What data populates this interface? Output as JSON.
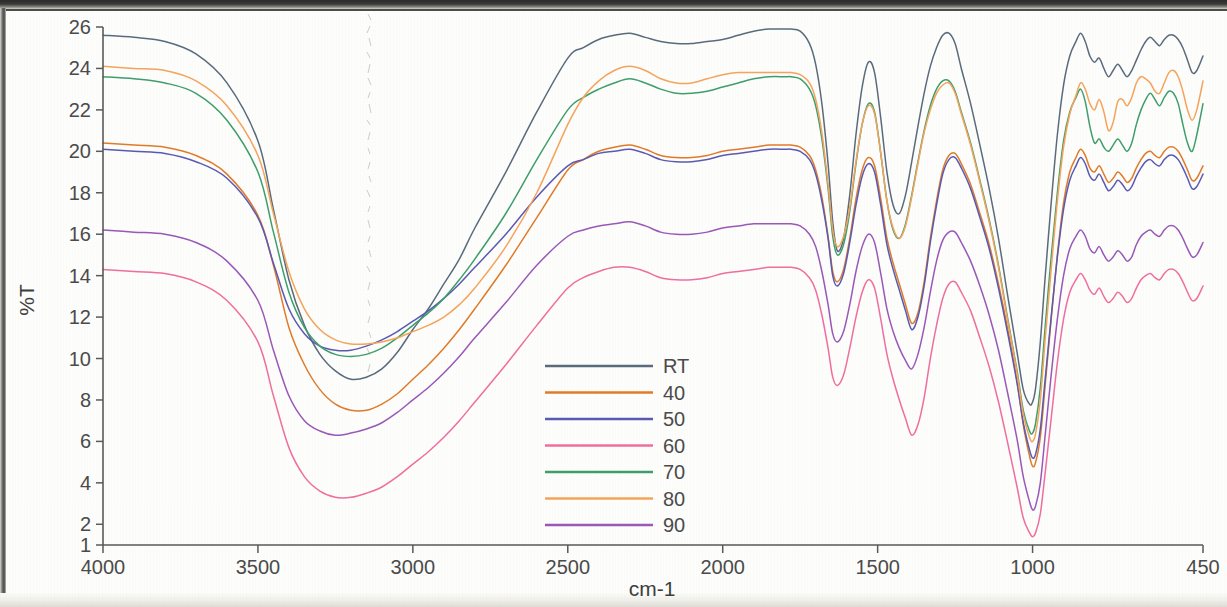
{
  "chart_data": {
    "type": "line",
    "title": "",
    "xlabel": "cm-1",
    "ylabel": "%T",
    "xlim": [
      4000,
      450
    ],
    "ylim": [
      1,
      26
    ],
    "x_ticks": [
      4000,
      3500,
      3000,
      2500,
      2000,
      1500,
      1000,
      450
    ],
    "x_tick_labels": [
      "4000",
      "3500",
      "3000",
      "2500",
      "2000",
      "1500",
      "1000",
      "450"
    ],
    "y_ticks": [
      1,
      2,
      4,
      6,
      8,
      10,
      12,
      14,
      16,
      18,
      20,
      22,
      24,
      26
    ],
    "y_tick_labels": [
      "1",
      "2",
      "4",
      "6",
      "8",
      "10",
      "12",
      "14",
      "16",
      "18",
      "20",
      "22",
      "24",
      "26"
    ],
    "x_axis_inverted": true,
    "grid": false,
    "legend_position": "center",
    "x": [
      4000,
      3900,
      3800,
      3700,
      3600,
      3500,
      3450,
      3400,
      3350,
      3300,
      3250,
      3200,
      3150,
      3100,
      3050,
      3000,
      2950,
      2900,
      2850,
      2800,
      2700,
      2600,
      2500,
      2450,
      2400,
      2350,
      2300,
      2250,
      2200,
      2150,
      2100,
      2050,
      2000,
      1950,
      1900,
      1850,
      1800,
      1780,
      1750,
      1720,
      1700,
      1680,
      1660,
      1645,
      1630,
      1610,
      1590,
      1570,
      1550,
      1530,
      1510,
      1490,
      1470,
      1450,
      1430,
      1410,
      1390,
      1370,
      1350,
      1330,
      1310,
      1290,
      1270,
      1250,
      1230,
      1200,
      1170,
      1140,
      1110,
      1080,
      1050,
      1030,
      1010,
      1000,
      990,
      975,
      960,
      940,
      920,
      900,
      880,
      860,
      845,
      830,
      815,
      800,
      785,
      770,
      755,
      740,
      725,
      710,
      695,
      680,
      665,
      650,
      635,
      620,
      605,
      590,
      575,
      560,
      545,
      530,
      515,
      500,
      485,
      470,
      450
    ],
    "series": [
      {
        "name": "RT",
        "color": "#5a6b7d",
        "values": [
          25.6,
          25.5,
          25.3,
          24.7,
          23.3,
          20.5,
          17.2,
          13.8,
          11.6,
          10.2,
          9.4,
          9.0,
          9.1,
          9.5,
          10.3,
          11.4,
          12.4,
          13.6,
          14.8,
          16.3,
          19.0,
          21.9,
          24.5,
          25.0,
          25.4,
          25.6,
          25.7,
          25.5,
          25.3,
          25.2,
          25.2,
          25.3,
          25.4,
          25.6,
          25.8,
          25.9,
          25.9,
          25.9,
          25.8,
          25.2,
          24.2,
          22.3,
          19.4,
          16.6,
          15.2,
          15.8,
          17.9,
          20.8,
          23.1,
          24.3,
          23.8,
          21.6,
          19.0,
          17.4,
          17.0,
          17.9,
          19.5,
          21.2,
          22.8,
          24.1,
          25.0,
          25.6,
          25.7,
          25.2,
          24.0,
          22.3,
          20.3,
          18.2,
          15.8,
          13.0,
          10.3,
          8.5,
          7.8,
          7.9,
          8.6,
          10.8,
          13.8,
          17.5,
          20.8,
          23.2,
          24.6,
          25.3,
          25.7,
          25.3,
          24.6,
          24.3,
          24.5,
          24.0,
          23.6,
          23.9,
          24.2,
          23.9,
          23.6,
          23.9,
          24.4,
          24.9,
          25.3,
          25.5,
          25.3,
          25.1,
          25.4,
          25.6,
          25.6,
          25.4,
          25.0,
          24.4,
          23.8,
          23.9,
          24.6
        ]
      },
      {
        "name": "40",
        "color": "#e07b2a",
        "values": [
          20.4,
          20.3,
          20.2,
          19.8,
          18.9,
          16.9,
          14.5,
          11.5,
          9.7,
          8.5,
          7.8,
          7.5,
          7.5,
          7.8,
          8.3,
          9.0,
          9.7,
          10.5,
          11.4,
          12.4,
          14.5,
          16.8,
          19.1,
          19.6,
          20.0,
          20.2,
          20.3,
          20.1,
          19.8,
          19.7,
          19.7,
          19.8,
          20.0,
          20.1,
          20.2,
          20.3,
          20.3,
          20.3,
          20.2,
          19.8,
          19.1,
          17.8,
          15.9,
          14.2,
          13.7,
          14.3,
          15.8,
          17.7,
          19.1,
          19.7,
          19.3,
          17.7,
          15.8,
          14.6,
          13.6,
          12.6,
          11.7,
          12.2,
          13.7,
          15.8,
          17.6,
          19.1,
          19.8,
          19.9,
          19.4,
          18.4,
          17.0,
          15.5,
          13.6,
          11.4,
          8.9,
          6.8,
          5.3,
          4.8,
          5.0,
          6.2,
          8.6,
          11.9,
          15.0,
          17.5,
          19.0,
          19.7,
          20.1,
          19.8,
          19.2,
          19.0,
          19.3,
          18.9,
          18.5,
          18.7,
          19.0,
          18.8,
          18.5,
          18.7,
          19.2,
          19.6,
          19.9,
          20.0,
          19.8,
          19.7,
          20.0,
          20.2,
          20.2,
          20.0,
          19.6,
          19.1,
          18.6,
          18.7,
          19.3
        ]
      },
      {
        "name": "50",
        "color": "#5a5ab4",
        "values": [
          20.1,
          20.0,
          19.9,
          19.5,
          18.7,
          16.8,
          14.6,
          12.4,
          11.2,
          10.6,
          10.4,
          10.4,
          10.6,
          10.9,
          11.3,
          11.8,
          12.3,
          12.9,
          13.6,
          14.4,
          16.0,
          17.8,
          19.3,
          19.6,
          19.9,
          20.0,
          20.1,
          19.9,
          19.6,
          19.5,
          19.5,
          19.6,
          19.8,
          19.9,
          20.0,
          20.1,
          20.1,
          20.1,
          20.0,
          19.6,
          18.9,
          17.6,
          15.8,
          14.0,
          13.5,
          14.1,
          15.6,
          17.4,
          18.8,
          19.4,
          19.0,
          17.4,
          15.5,
          14.3,
          13.3,
          12.3,
          11.4,
          12.0,
          13.5,
          15.6,
          17.4,
          18.9,
          19.6,
          19.7,
          19.2,
          18.2,
          16.8,
          15.3,
          13.4,
          11.2,
          8.8,
          6.9,
          5.6,
          5.2,
          5.4,
          6.6,
          8.9,
          12.0,
          14.9,
          17.2,
          18.6,
          19.3,
          19.7,
          19.4,
          18.8,
          18.6,
          18.9,
          18.5,
          18.1,
          18.3,
          18.6,
          18.4,
          18.1,
          18.3,
          18.8,
          19.2,
          19.5,
          19.6,
          19.4,
          19.3,
          19.6,
          19.8,
          19.8,
          19.6,
          19.2,
          18.7,
          18.2,
          18.3,
          18.9
        ]
      },
      {
        "name": "60",
        "color": "#f06ea0",
        "values": [
          14.3,
          14.2,
          14.1,
          13.7,
          12.8,
          10.8,
          8.2,
          5.7,
          4.3,
          3.6,
          3.3,
          3.3,
          3.5,
          3.8,
          4.3,
          4.9,
          5.5,
          6.2,
          7.0,
          7.9,
          9.7,
          11.6,
          13.4,
          13.9,
          14.2,
          14.4,
          14.4,
          14.2,
          13.9,
          13.8,
          13.8,
          13.9,
          14.1,
          14.2,
          14.3,
          14.4,
          14.4,
          14.4,
          14.3,
          13.9,
          13.3,
          12.1,
          10.5,
          9.1,
          8.7,
          9.2,
          10.5,
          12.0,
          13.2,
          13.8,
          13.4,
          11.9,
          10.2,
          9.0,
          8.0,
          7.1,
          6.3,
          6.8,
          8.1,
          10.0,
          11.6,
          12.9,
          13.6,
          13.7,
          13.2,
          12.3,
          11.0,
          9.6,
          7.9,
          5.9,
          3.8,
          2.3,
          1.6,
          1.4,
          1.6,
          2.5,
          4.4,
          7.1,
          9.8,
          11.9,
          13.2,
          13.8,
          14.1,
          13.8,
          13.3,
          13.1,
          13.4,
          13.0,
          12.7,
          12.9,
          13.2,
          13.0,
          12.7,
          12.9,
          13.4,
          13.8,
          14.0,
          14.1,
          13.9,
          13.8,
          14.1,
          14.3,
          14.3,
          14.1,
          13.7,
          13.2,
          12.8,
          12.9,
          13.5
        ]
      },
      {
        "name": "70",
        "color": "#3f9e6c",
        "values": [
          23.6,
          23.5,
          23.3,
          22.8,
          21.5,
          19.0,
          16.1,
          13.2,
          11.5,
          10.6,
          10.2,
          10.1,
          10.2,
          10.5,
          11.0,
          11.6,
          12.2,
          12.9,
          13.8,
          14.8,
          17.0,
          19.6,
          22.0,
          22.6,
          23.0,
          23.3,
          23.5,
          23.3,
          23.0,
          22.8,
          22.8,
          22.9,
          23.1,
          23.3,
          23.5,
          23.6,
          23.6,
          23.6,
          23.5,
          23.0,
          22.2,
          20.6,
          18.2,
          15.9,
          15.0,
          15.5,
          17.1,
          19.4,
          21.3,
          22.3,
          21.9,
          19.9,
          17.6,
          16.2,
          15.8,
          16.5,
          17.9,
          19.5,
          21.0,
          22.2,
          23.0,
          23.4,
          23.4,
          22.9,
          21.9,
          20.4,
          18.6,
          16.7,
          14.5,
          11.9,
          9.4,
          7.5,
          6.5,
          6.4,
          6.9,
          8.6,
          11.4,
          14.9,
          18.0,
          20.5,
          21.9,
          22.6,
          23.0,
          22.4,
          21.2,
          20.4,
          20.6,
          20.2,
          20.0,
          20.3,
          20.6,
          20.3,
          20.0,
          20.4,
          21.3,
          22.0,
          22.5,
          22.8,
          22.5,
          22.2,
          22.6,
          22.9,
          22.8,
          22.3,
          21.3,
          20.4,
          20.0,
          20.8,
          22.3
        ]
      },
      {
        "name": "80",
        "color": "#f5a45c",
        "values": [
          24.1,
          24.0,
          23.9,
          23.4,
          22.2,
          19.8,
          17.0,
          14.2,
          12.4,
          11.4,
          10.9,
          10.7,
          10.7,
          10.8,
          11.0,
          11.3,
          11.6,
          12.0,
          12.6,
          13.4,
          15.4,
          18.0,
          21.3,
          22.6,
          23.4,
          23.9,
          24.1,
          23.9,
          23.5,
          23.3,
          23.3,
          23.5,
          23.7,
          23.8,
          23.8,
          23.8,
          23.8,
          23.8,
          23.7,
          23.3,
          22.5,
          20.9,
          18.4,
          16.2,
          15.4,
          15.9,
          17.3,
          19.5,
          21.3,
          22.2,
          21.8,
          19.9,
          17.6,
          16.3,
          15.8,
          16.4,
          17.8,
          19.4,
          20.9,
          22.0,
          22.8,
          23.2,
          23.3,
          22.8,
          21.8,
          20.3,
          18.5,
          16.6,
          14.4,
          11.8,
          9.3,
          7.3,
          6.2,
          6.0,
          6.4,
          8.0,
          10.8,
          14.3,
          17.6,
          20.2,
          21.8,
          22.7,
          23.3,
          23.0,
          22.3,
          22.0,
          22.5,
          21.9,
          21.0,
          21.4,
          22.4,
          22.5,
          22.2,
          22.6,
          23.3,
          23.6,
          23.5,
          23.3,
          22.9,
          22.8,
          23.3,
          23.8,
          23.9,
          23.6,
          22.9,
          22.0,
          21.5,
          22.0,
          23.4
        ]
      },
      {
        "name": "90",
        "color": "#9a58b8",
        "values": [
          16.2,
          16.1,
          16.0,
          15.6,
          14.7,
          12.8,
          10.4,
          8.2,
          7.0,
          6.5,
          6.3,
          6.4,
          6.6,
          6.9,
          7.4,
          8.0,
          8.6,
          9.3,
          10.1,
          11.0,
          12.7,
          14.5,
          15.9,
          16.2,
          16.4,
          16.5,
          16.6,
          16.4,
          16.1,
          16.0,
          16.0,
          16.1,
          16.3,
          16.4,
          16.5,
          16.5,
          16.5,
          16.5,
          16.4,
          16.0,
          15.4,
          14.2,
          12.6,
          11.2,
          10.8,
          11.3,
          12.6,
          14.2,
          15.4,
          16.0,
          15.6,
          14.1,
          12.4,
          11.3,
          10.5,
          9.9,
          9.5,
          10.2,
          11.5,
          13.2,
          14.7,
          15.7,
          16.1,
          16.1,
          15.6,
          14.7,
          13.5,
          12.1,
          10.4,
          8.3,
          6.1,
          4.3,
          3.1,
          2.7,
          2.9,
          4.0,
          6.2,
          9.2,
          11.9,
          14.0,
          15.3,
          15.9,
          16.2,
          15.9,
          15.3,
          15.1,
          15.4,
          15.0,
          14.7,
          14.9,
          15.2,
          15.0,
          14.7,
          14.9,
          15.5,
          15.9,
          16.1,
          16.2,
          16.0,
          15.9,
          16.2,
          16.4,
          16.4,
          16.2,
          15.8,
          15.3,
          14.9,
          15.0,
          15.6
        ]
      }
    ]
  },
  "legend": {
    "entries": [
      {
        "label": "RT",
        "color": "#5a6b7d"
      },
      {
        "label": "40",
        "color": "#e07b2a"
      },
      {
        "label": "50",
        "color": "#5a5ab4"
      },
      {
        "label": "60",
        "color": "#f06ea0"
      },
      {
        "label": "70",
        "color": "#3f9e6c"
      },
      {
        "label": "80",
        "color": "#f5a45c"
      },
      {
        "label": "90",
        "color": "#9a58b8"
      }
    ]
  }
}
